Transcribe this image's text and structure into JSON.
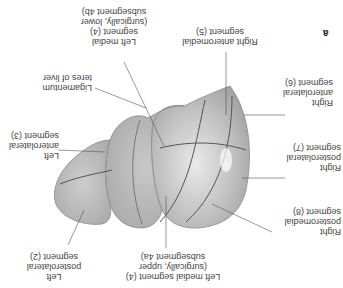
{
  "figure": {
    "panel_label": "a",
    "orientation": "rotated 180 degrees",
    "labels": {
      "right_anteromedial": "Right anteromedial\nsegment (5)",
      "left_medial_lower": "Left medial\nsegment (4)\n(surgically, lower\nsubsegment 4b)",
      "ligamentum": "Ligamentum\nteres of liver",
      "left_anterolateral": "Left\nanterolateral\nsegment (3)",
      "right_anterolateral": "Right\nanterolateral\nsegment (6)",
      "right_posterolateral": "Right\nposterolateral\nsegment (7)",
      "right_posteromedial": "Right\nposteromedial\nsegment (8)",
      "left_medial_upper": "Left medial segment (4)\n(surgically, upper\nsubsegment 4a)",
      "left_posterolateral": "Left\nposterolateral\nsegment (2)"
    }
  }
}
